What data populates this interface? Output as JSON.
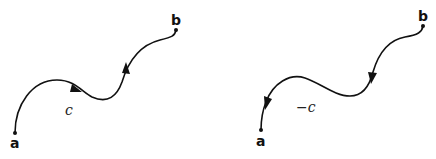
{
  "diagram": {
    "colors": {
      "stroke": "#111111",
      "background": "#ffffff"
    },
    "left": {
      "start_label": "a",
      "end_label": "b",
      "curve_label": "c",
      "direction": "a-to-b"
    },
    "right": {
      "start_label": "b",
      "end_label": "a",
      "curve_label": "−c",
      "direction": "b-to-a"
    }
  }
}
